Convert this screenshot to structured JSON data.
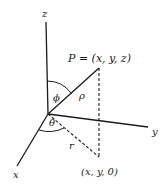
{
  "diagram": {
    "axes": {
      "x_label": "x",
      "y_label": "y",
      "z_label": "z"
    },
    "point_label": "P = (x, y, z)",
    "projection_label": "(x, y, 0)",
    "rho_label": "ρ",
    "r_label": "r",
    "phi_label": "ϕ",
    "theta_label": "θ",
    "colors": {
      "line": "#1a1a1a",
      "background": "#ffffff"
    }
  }
}
